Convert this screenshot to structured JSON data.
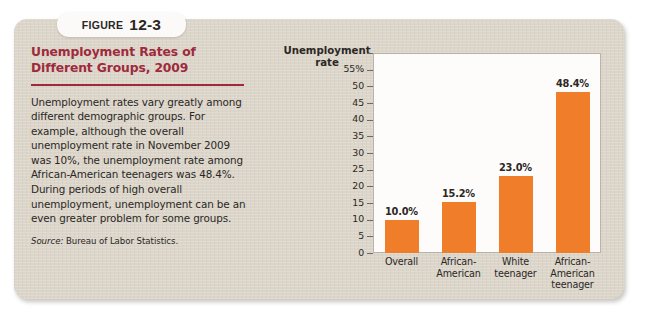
{
  "figure": {
    "label_word": "FIGURE",
    "number": "12-3",
    "title": "Unemployment Rates of Different Groups, 2009",
    "body": "Unemployment rates vary greatly among different demographic groups. For example, although the overall unemployment rate in November 2009 was 10%, the unemployment rate among African-American teenagers was 48.4%. During periods of high overall unemployment, unemployment can be an even greater problem for some groups.",
    "source_label": "Source:",
    "source_text": "Bureau of Labor Statistics."
  },
  "colors": {
    "panel_background": "#dcd5ca",
    "title_maroon": "#9e2a3c",
    "bar_orange": "#ef7d2a",
    "plot_background": "#fdfcfa",
    "axis_line": "#b9b2a7",
    "text": "#2b2824"
  },
  "chart_data": {
    "type": "bar",
    "title": "",
    "ylabel": "Unemployment rate",
    "xlabel": "",
    "categories": [
      "Overall",
      "African-American",
      "White teenager",
      "African-American teenager"
    ],
    "category_lines": [
      [
        "Overall"
      ],
      [
        "African-",
        "American"
      ],
      [
        "White",
        "teenager"
      ],
      [
        "African-",
        "American",
        "teenager"
      ]
    ],
    "values": [
      10.0,
      15.2,
      23.0,
      48.4
    ],
    "value_labels": [
      "10.0%",
      "15.2%",
      "23.0%",
      "48.4%"
    ],
    "ylim": [
      0,
      60
    ],
    "yticks": [
      0,
      5,
      10,
      15,
      20,
      25,
      30,
      35,
      40,
      45,
      50,
      55,
      60
    ],
    "ytick_labels": [
      "0",
      "5",
      "10",
      "15",
      "20",
      "25",
      "30",
      "35",
      "40",
      "45",
      "50",
      "55%",
      ""
    ],
    "grid": false,
    "legend": "none"
  }
}
